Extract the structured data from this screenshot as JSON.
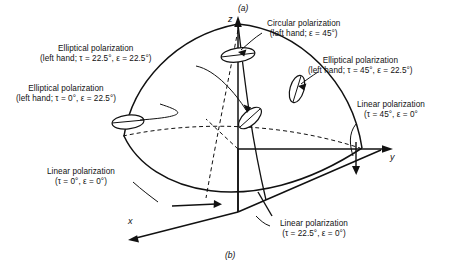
{
  "figure": {
    "caption_top": "(a)",
    "caption_bottom": "(b)",
    "axes": {
      "z": "z",
      "y": "y",
      "x": "x"
    }
  },
  "annotations": [
    {
      "name": "elliptical-22-22",
      "line1": "Elliptical polarization",
      "line2": "(left hand; τ = 22.5°, ε = 22.5°)"
    },
    {
      "name": "elliptical-0-22",
      "line1": "Elliptical polarization",
      "line2": "(left hand; τ = 0°, ε = 22.5°)"
    },
    {
      "name": "circular-45",
      "line1": "Circular polarization",
      "line2": "(left hand; ε = 45°)"
    },
    {
      "name": "elliptical-45-22",
      "line1": "Elliptical polarization",
      "line2": "(left hand; τ = 45°, ε = 22.5°)"
    },
    {
      "name": "linear-45-0",
      "line1": "Linear polarization",
      "line2": "(τ = 45°, ε = 0°"
    },
    {
      "name": "linear-0-0",
      "line1": "Linear polarization",
      "line2": "(τ = 0°, ε = 0°)"
    },
    {
      "name": "linear-22-0",
      "line1": "Linear polarization",
      "line2": "(τ = 22.5°, ε = 0°)"
    }
  ]
}
